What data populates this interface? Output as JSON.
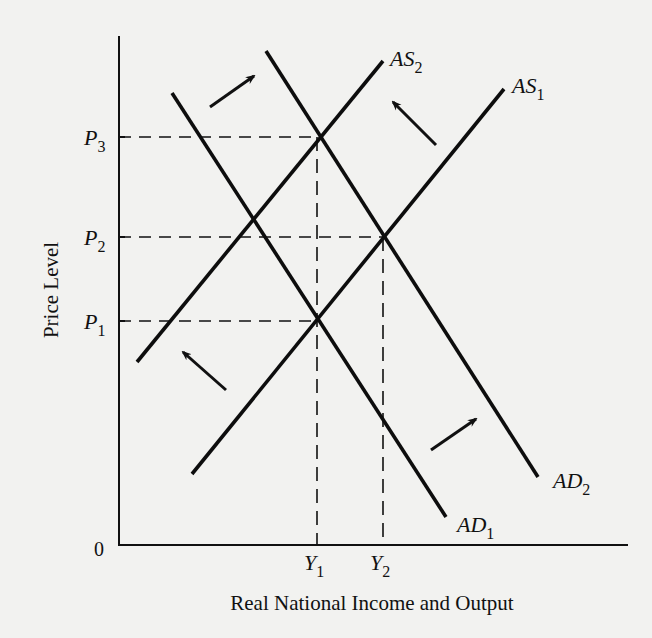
{
  "chart_data": {
    "type": "line",
    "title": "",
    "xlabel": "Real National Income and Output",
    "ylabel": "Price Level",
    "origin_label": "0",
    "y_ticks": [
      {
        "label": "P",
        "sub": "1",
        "y": 321
      },
      {
        "label": "P",
        "sub": "2",
        "y": 237
      },
      {
        "label": "P",
        "sub": "3",
        "y": 137
      }
    ],
    "x_ticks": [
      {
        "label": "Y",
        "sub": "1",
        "x": 317
      },
      {
        "label": "Y",
        "sub": "2",
        "x": 383
      }
    ],
    "series": [
      {
        "name": "AS1",
        "label": "AS",
        "sub": "1",
        "kind": "aggregate supply",
        "points": [
          [
            192,
            474
          ],
          [
            504,
            89
          ]
        ]
      },
      {
        "name": "AS2",
        "label": "AS",
        "sub": "2",
        "kind": "aggregate supply",
        "points": [
          [
            137,
            362
          ],
          [
            383,
            61
          ]
        ]
      },
      {
        "name": "AD1",
        "label": "AD",
        "sub": "1",
        "kind": "aggregate demand",
        "points": [
          [
            172,
            93
          ],
          [
            446,
            517
          ]
        ]
      },
      {
        "name": "AD2",
        "label": "AD",
        "sub": "2",
        "kind": "aggregate demand",
        "points": [
          [
            266,
            51
          ],
          [
            538,
            477
          ]
        ]
      }
    ],
    "equilibria": [
      {
        "name": "AS1xAD1",
        "price": "P1",
        "output": "Y1"
      },
      {
        "name": "AS1xAD2",
        "price": "P2",
        "output": "Y2"
      },
      {
        "name": "AS2xAD2",
        "price": "P3",
        "output": "Y1"
      }
    ],
    "shift_arrows": [
      {
        "name": "AD shift right (upper)",
        "from": [
          210,
          107
        ],
        "to": [
          254,
          76
        ]
      },
      {
        "name": "AS shift left (upper)",
        "from": [
          436,
          145
        ],
        "to": [
          393,
          102
        ]
      },
      {
        "name": "AS shift left (lower)",
        "from": [
          226,
          390
        ],
        "to": [
          183,
          352
        ]
      },
      {
        "name": "AD shift right (lower)",
        "from": [
          431,
          450
        ],
        "to": [
          476,
          419
        ]
      }
    ],
    "grid": false,
    "legend": "inline labels at line ends"
  }
}
